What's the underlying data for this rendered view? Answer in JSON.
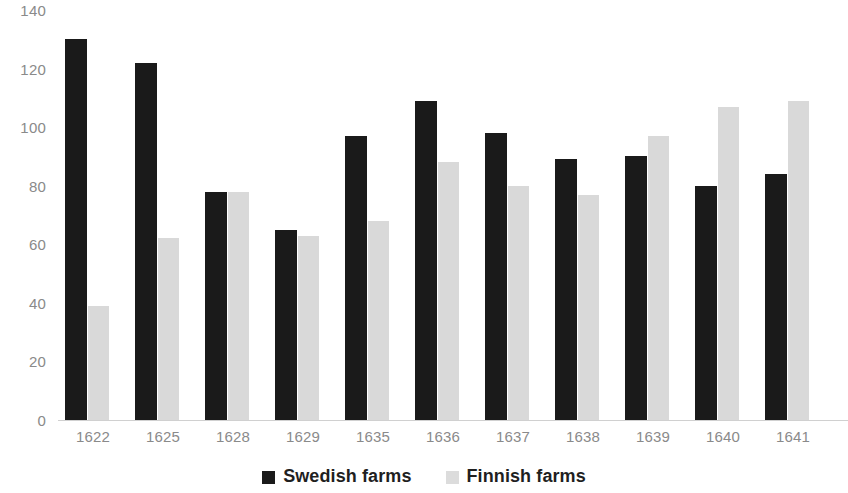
{
  "chart_data": {
    "type": "bar",
    "title": "",
    "subtitle": "",
    "xlabel": "",
    "ylabel": "",
    "ylim": [
      0,
      140
    ],
    "yticks": [
      0,
      20,
      40,
      60,
      80,
      100,
      120,
      140
    ],
    "grid": false,
    "legend_position": "bottom",
    "categories": [
      "1622",
      "1625",
      "1628",
      "1629",
      "1635",
      "1636",
      "1637",
      "1638",
      "1639",
      "1640",
      "1641"
    ],
    "series": [
      {
        "name": "Swedish farms",
        "color": "#1a1a1a",
        "values": [
          130,
          122,
          78,
          65,
          97,
          109,
          98,
          89,
          90,
          80,
          84
        ]
      },
      {
        "name": "Finnish farms",
        "color": "#d9d9d9",
        "values": [
          39,
          62,
          78,
          63,
          68,
          88,
          80,
          77,
          97,
          107,
          109
        ]
      }
    ]
  },
  "legend": {
    "items": [
      {
        "label": "Swedish farms",
        "swatch": "legend-swatch-black"
      },
      {
        "label": "Finnish farms",
        "swatch": "legend-swatch-gray"
      }
    ]
  }
}
